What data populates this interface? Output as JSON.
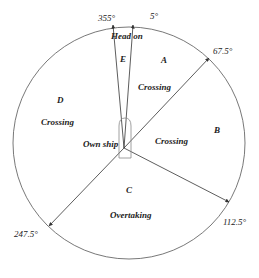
{
  "diagram": {
    "type": "ship-encounter-sectors",
    "center_label": "Own ship",
    "angles": {
      "a355": "355°",
      "a5": "5°",
      "a67": "67.5°",
      "a112": "112.5°",
      "a247": "247.5°"
    },
    "sectors": [
      {
        "id": "E",
        "letter": "E",
        "name": "Head on",
        "from": "355°",
        "to": "5°"
      },
      {
        "id": "A",
        "letter": "A",
        "name": "Crossing",
        "from": "5°",
        "to": "67.5°"
      },
      {
        "id": "B",
        "letter": "B",
        "name": "Crossing",
        "from": "67.5°",
        "to": "112.5°"
      },
      {
        "id": "C",
        "letter": "C",
        "name": "Overtaking",
        "from": "112.5°",
        "to": "247.5°"
      },
      {
        "id": "D",
        "letter": "D",
        "name": "Crossing",
        "from": "247.5°",
        "to": "355°"
      }
    ],
    "colors": {
      "line": "#333333",
      "text": "#222222",
      "background": "#ffffff"
    }
  }
}
